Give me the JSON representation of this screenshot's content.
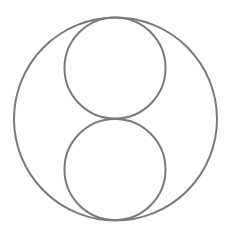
{
  "canvas": {
    "width": 228,
    "height": 237,
    "background_color": "#ffffff",
    "title": "Three tangent circles figure"
  },
  "style": {
    "stroke_color": "#7a7a7a",
    "stroke_width": 2,
    "fill": "none"
  },
  "chart_data": {
    "type": "diagram",
    "title": "",
    "subtitle": "",
    "xlabel": "",
    "ylabel": "",
    "grid": false,
    "legend": "none",
    "xlim": [
      0,
      228
    ],
    "ylim": [
      0,
      237
    ],
    "shapes": [
      {
        "name": "outer-circle",
        "type": "circle",
        "cx": 115.5,
        "cy": 119,
        "r": 101.5,
        "stroke": "#7a7a7a",
        "stroke_width": 2,
        "fill": "none"
      },
      {
        "name": "upper-inner-circle",
        "type": "circle",
        "cx": 115,
        "cy": 68,
        "r": 50.5,
        "stroke": "#7a7a7a",
        "stroke_width": 2,
        "fill": "none"
      },
      {
        "name": "lower-inner-circle",
        "type": "circle",
        "cx": 115,
        "cy": 169.5,
        "r": 50.5,
        "stroke": "#7a7a7a",
        "stroke_width": 2,
        "fill": "none"
      }
    ],
    "tangency_points": [
      {
        "name": "top-tangency",
        "x": 115,
        "y": 17.5
      },
      {
        "name": "middle-tangency",
        "x": 115,
        "y": 118.5
      },
      {
        "name": "bottom-tangency",
        "x": 115,
        "y": 220
      }
    ]
  }
}
